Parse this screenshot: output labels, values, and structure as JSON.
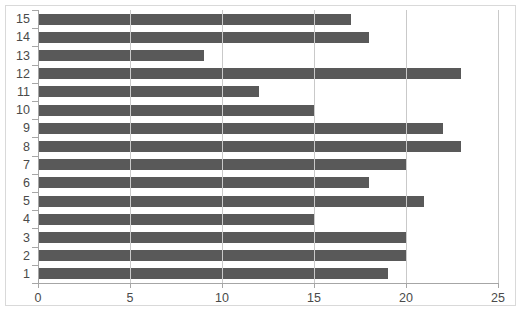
{
  "chart_data": {
    "type": "bar",
    "orientation": "horizontal",
    "title": "",
    "subtitle": "",
    "xlabel": "",
    "ylabel": "",
    "categories": [
      "1",
      "2",
      "3",
      "4",
      "5",
      "6",
      "7",
      "8",
      "9",
      "10",
      "11",
      "12",
      "13",
      "14",
      "15"
    ],
    "values": [
      19,
      20,
      20,
      15,
      21,
      18,
      20,
      23,
      22,
      15,
      12,
      23,
      9,
      18,
      17
    ],
    "xlim": [
      0,
      25
    ],
    "xticks": [
      "0",
      "5",
      "10",
      "15",
      "20",
      "25"
    ],
    "xtick_values": [
      0,
      5,
      10,
      15,
      20,
      25
    ],
    "yticks": [
      "1",
      "2",
      "3",
      "4",
      "5",
      "6",
      "7",
      "8",
      "9",
      "10",
      "11",
      "12",
      "13",
      "14",
      "15"
    ],
    "grid": "vertical-only",
    "legend": "none",
    "legend_position": "none",
    "bar_color": "#595959",
    "gridline_color": "#c9c9c9",
    "axis_color": "#a6a6a6",
    "frame_color": "#d9d9d9",
    "background_color": "#ffffff",
    "tick_label_color": "#4a4a4a"
  }
}
